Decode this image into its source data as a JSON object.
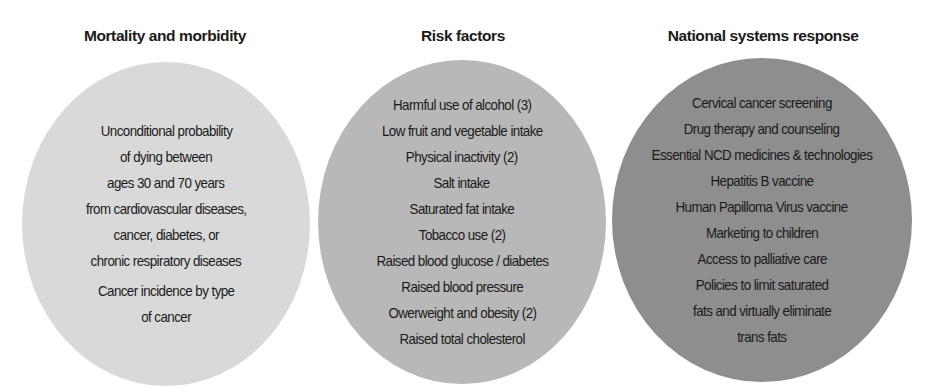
{
  "columns": [
    {
      "heading": "Mortality and morbidity",
      "color": "#d9d9d9",
      "items": [
        "Unconditional probability",
        "of dying between",
        "ages 30 and 70 years",
        "from cardiovascular diseases,",
        "cancer, diabetes, or",
        "chronic respiratory diseases",
        "Cancer incidence by type",
        "of cancer"
      ]
    },
    {
      "heading": "Risk factors",
      "color": "#b8b8b8",
      "items": [
        "Harmful use of alcohol (3)",
        "Low fruit and vegetable intake",
        "Physical inactivity (2)",
        "Salt intake",
        "Saturated fat intake",
        "Tobacco use (2)",
        "Raised blood glucose / diabetes",
        "Raised blood pressure",
        "Owerweight and obesity (2)",
        "Raised total cholesterol"
      ]
    },
    {
      "heading": "National systems response",
      "color": "#8e8e8e",
      "items": [
        "Cervical cancer screening",
        "Drug therapy and counseling",
        "Essential NCD medicines & technologies",
        "Hepatitis B vaccine",
        "Human Papilloma Virus vaccine",
        "Marketing to children",
        "Access to palliative care",
        "Policies to limit saturated",
        "fats and virtually eliminate",
        "trans fats"
      ]
    }
  ]
}
